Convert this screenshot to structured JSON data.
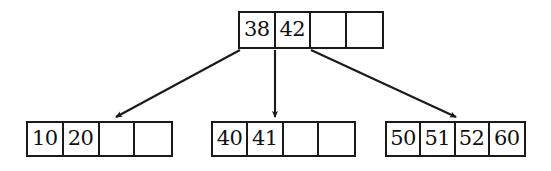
{
  "diagram": {
    "type": "b-tree",
    "order": 5,
    "cells_per_node": 4,
    "ink_color": "#1a1a1a",
    "background_color": "#ffffff"
  },
  "nodes": {
    "root": {
      "id": "root",
      "role": "root-node",
      "keys": [
        "38",
        "42"
      ],
      "cells": [
        "38",
        "42",
        "",
        ""
      ],
      "occupied": 2,
      "capacity": 4
    },
    "leaves": [
      {
        "id": "leaf-0",
        "role": "leaf-node",
        "position": "left",
        "keys": [
          "10",
          "20"
        ],
        "cells": [
          "10",
          "20",
          "",
          ""
        ],
        "occupied": 2,
        "capacity": 4
      },
      {
        "id": "leaf-1",
        "role": "leaf-node",
        "position": "middle",
        "keys": [
          "40",
          "41"
        ],
        "cells": [
          "40",
          "41",
          "",
          ""
        ],
        "occupied": 2,
        "capacity": 4
      },
      {
        "id": "leaf-2",
        "role": "leaf-node",
        "position": "right",
        "keys": [
          "50",
          "51",
          "52",
          "60"
        ],
        "cells": [
          "50",
          "51",
          "52",
          "60"
        ],
        "occupied": 4,
        "capacity": 4
      }
    ]
  },
  "edges": [
    {
      "id": "edge-root-to-leaf-0",
      "from": "root",
      "to": "leaf-0",
      "pointer_index": 0,
      "style": "arrow"
    },
    {
      "id": "edge-root-to-leaf-1",
      "from": "root",
      "to": "leaf-1",
      "pointer_index": 1,
      "style": "arrow"
    },
    {
      "id": "edge-root-to-leaf-2",
      "from": "root",
      "to": "leaf-2",
      "pointer_index": 2,
      "style": "arrow"
    }
  ]
}
